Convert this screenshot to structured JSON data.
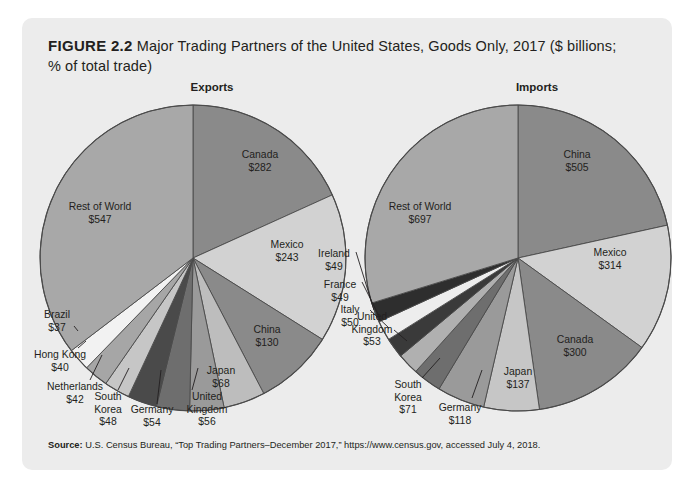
{
  "figure": {
    "number_label": "FIGURE 2.2",
    "title_text": "Major Trading Partners of the United States, Goods Only, 2017 ($ billions; % of total trade)",
    "source_label": "Source:",
    "source_text": "U.S. Census Bureau, “Top Trading Partners–December 2017,” https://www.census.gov, accessed July 4, 2018."
  },
  "chart_data": [
    {
      "type": "pie",
      "title": "Exports",
      "unit": "$ billions",
      "categories": [
        "Canada",
        "Mexico",
        "China",
        "Japan",
        "United Kingdom",
        "Germany",
        "South Korea",
        "Netherlands",
        "Hong Kong",
        "Brazil",
        "Rest of World"
      ],
      "values": [
        282,
        243,
        130,
        68,
        56,
        54,
        48,
        42,
        40,
        37,
        547
      ],
      "labels": [
        "Canada\n$282",
        "Mexico\n$243",
        "China\n$130",
        "Japan\n$68",
        "United\nKingdom\n$56",
        "Germany\n$54",
        "South\nKorea\n$48",
        "Netherlands\n$42",
        "Hong Kong\n$40",
        "Brazil\n$37",
        "Rest of World\n$547"
      ],
      "value_labels": [
        "$282",
        "$243",
        "$130",
        "$68",
        "$56",
        "$54",
        "$48",
        "$42",
        "$40",
        "$37",
        "$547"
      ],
      "colors": [
        "#8a8a8a",
        "#d2d2d2",
        "#8a8a8a",
        "#bdbdbd",
        "#9a9a9a",
        "#6e6e6e",
        "#4a4a4a",
        "#c6c6c6",
        "#a6a6a6",
        "#f2f2f2",
        "#a8a8a8"
      ],
      "total": 1547,
      "start_angle_deg": 0,
      "direction": "clockwise",
      "legend": "none"
    },
    {
      "type": "pie",
      "title": "Imports",
      "unit": "$ billions",
      "categories": [
        "China",
        "Mexico",
        "Canada",
        "Japan",
        "Germany",
        "South Korea",
        "United Kingdom",
        "Italy",
        "France",
        "Ireland",
        "Rest of World"
      ],
      "values": [
        505,
        314,
        300,
        137,
        118,
        71,
        53,
        50,
        49,
        49,
        697
      ],
      "labels": [
        "China\n$505",
        "Mexico\n$314",
        "Canada\n$300",
        "Japan\n$137",
        "Germany\n$118",
        "South\nKorea\n$71",
        "United\nKingdom\n$53",
        "Italy\n$50",
        "France\n$49",
        "Ireland\n$49",
        "Rest of World\n$697"
      ],
      "value_labels": [
        "$505",
        "$314",
        "$300",
        "$137",
        "$118",
        "$71",
        "$53",
        "$50",
        "$49",
        "$49",
        "$697"
      ],
      "colors": [
        "#8a8a8a",
        "#d2d2d2",
        "#8a8a8a",
        "#c6c6c6",
        "#9a9a9a",
        "#6e6e6e",
        "#b0b0b0",
        "#3a3a3a",
        "#ededed",
        "#2e2e2e",
        "#a8a8a8"
      ],
      "total": 2343,
      "start_angle_deg": 0,
      "direction": "clockwise",
      "legend": "none"
    }
  ],
  "exports_labels": [
    {
      "name": "Canada",
      "line1": "Canada",
      "line2": "$282"
    },
    {
      "name": "Mexico",
      "line1": "Mexico",
      "line2": "$243"
    },
    {
      "name": "China",
      "line1": "China",
      "line2": "$130"
    },
    {
      "name": "Japan",
      "line1": "Japan",
      "line2": "$68"
    },
    {
      "name": "United Kingdom",
      "line1": "United",
      "line2": "Kingdom",
      "line3": "$56"
    },
    {
      "name": "Germany",
      "line1": "Germany",
      "line2": "$54"
    },
    {
      "name": "South Korea",
      "line1": "South",
      "line2": "Korea",
      "line3": "$48"
    },
    {
      "name": "Netherlands",
      "line1": "Netherlands",
      "line2": "$42"
    },
    {
      "name": "Hong Kong",
      "line1": "Hong Kong",
      "line2": "$40"
    },
    {
      "name": "Brazil",
      "line1": "Brazil",
      "line2": "$37"
    },
    {
      "name": "Rest of World",
      "line1": "Rest of World",
      "line2": "$547"
    }
  ],
  "imports_labels": [
    {
      "name": "China",
      "line1": "China",
      "line2": "$505"
    },
    {
      "name": "Mexico",
      "line1": "Mexico",
      "line2": "$314"
    },
    {
      "name": "Canada",
      "line1": "Canada",
      "line2": "$300"
    },
    {
      "name": "Japan",
      "line1": "Japan",
      "line2": "$137"
    },
    {
      "name": "Germany",
      "line1": "Germany",
      "line2": "$118"
    },
    {
      "name": "South Korea",
      "line1": "South",
      "line2": "Korea",
      "line3": "$71"
    },
    {
      "name": "United Kingdom",
      "line1": "United",
      "line2": "Kingdom",
      "line3": "$53"
    },
    {
      "name": "Italy",
      "line1": "Italy",
      "line2": "$50"
    },
    {
      "name": "France",
      "line1": "France",
      "line2": "$49"
    },
    {
      "name": "Ireland",
      "line1": "Ireland",
      "line2": "$49"
    },
    {
      "name": "Rest of World",
      "line1": "Rest of World",
      "line2": "$697"
    }
  ]
}
